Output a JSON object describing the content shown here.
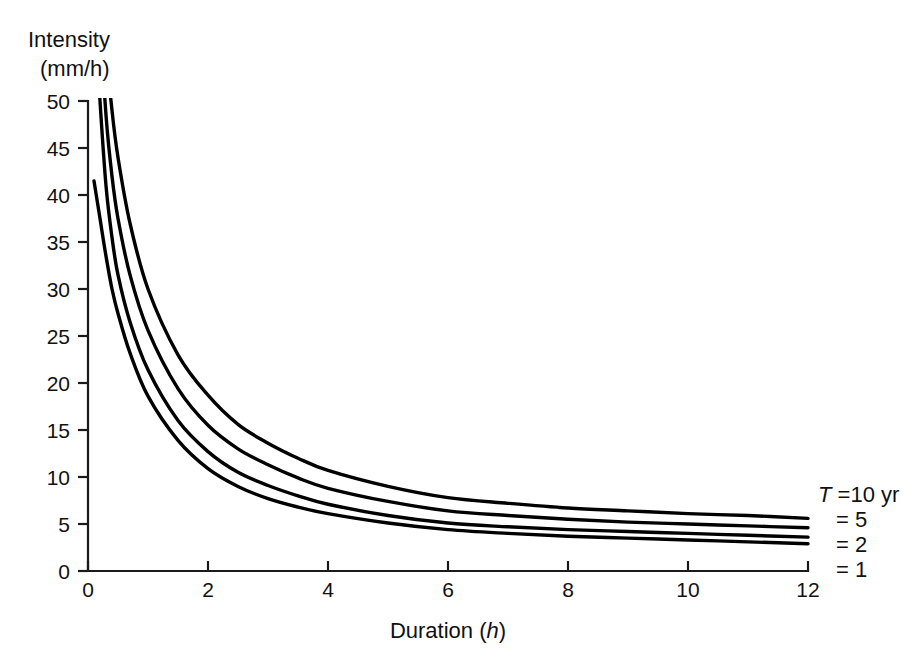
{
  "chart_data": {
    "type": "line",
    "title": "",
    "xlabel": "Duration (h)",
    "ylabel": "Intensity (mm/h)",
    "xlim": [
      0,
      12
    ],
    "ylim": [
      0,
      50
    ],
    "grid": false,
    "legend_position": "right",
    "x_ticks": [
      0,
      2,
      4,
      6,
      8,
      10,
      12
    ],
    "x_tick_labels": [
      "0",
      "2",
      "4",
      "6",
      "8",
      "10",
      "12"
    ],
    "y_ticks": [
      0,
      5,
      10,
      15,
      20,
      25,
      30,
      35,
      40,
      45,
      50
    ],
    "y_tick_labels": [
      "0",
      "5",
      "10",
      "15",
      "20",
      "25",
      "30",
      "35",
      "40",
      "45",
      "50"
    ],
    "x": [
      0.1,
      0.15,
      0.2,
      0.3,
      0.4,
      0.5,
      0.7,
      1.0,
      1.5,
      2.0,
      2.5,
      3.0,
      3.5,
      4.0,
      5.0,
      6.0,
      7.0,
      8.0,
      9.0,
      10.0,
      11.0,
      12.0
    ],
    "series": [
      {
        "name": "T = 10 yr",
        "legend_label": "T =10 yr",
        "values": [
          88.0,
          76.0,
          68.0,
          56.0,
          49.0,
          44.0,
          37.0,
          30.0,
          23.0,
          18.7,
          15.6,
          13.6,
          12.0,
          10.7,
          9.0,
          7.8,
          7.2,
          6.7,
          6.4,
          6.1,
          5.9,
          5.6
        ],
        "color": "#000000"
      },
      {
        "name": "T = 5 yr",
        "legend_label": "= 5",
        "values": [
          76.0,
          66.0,
          59.0,
          48.5,
          42.0,
          37.5,
          31.5,
          25.6,
          19.4,
          15.5,
          13.0,
          11.3,
          9.9,
          8.8,
          7.4,
          6.4,
          5.9,
          5.5,
          5.2,
          5.0,
          4.8,
          4.6
        ],
        "color": "#000000"
      },
      {
        "name": "T = 2 yr",
        "legend_label": "= 2",
        "values": [
          64.0,
          56.0,
          50.0,
          41.0,
          35.5,
          31.5,
          26.5,
          21.4,
          16.0,
          12.7,
          10.5,
          9.1,
          8.0,
          7.1,
          5.9,
          5.1,
          4.7,
          4.4,
          4.2,
          4.0,
          3.8,
          3.6
        ],
        "color": "#000000"
      },
      {
        "name": "T = 1 yr",
        "legend_label": "= 1",
        "values": [
          41.5,
          39.5,
          37.5,
          33.5,
          30.0,
          27.4,
          23.2,
          18.6,
          13.9,
          10.9,
          9.0,
          7.7,
          6.8,
          6.1,
          5.1,
          4.4,
          4.0,
          3.7,
          3.5,
          3.3,
          3.1,
          2.9
        ],
        "color": "#000000"
      }
    ],
    "legend_entries": [
      {
        "label_prefix": "T",
        "label_rest": " =10 yr",
        "italic_prefix": true
      },
      {
        "label_prefix": "",
        "label_rest": "= 5",
        "italic_prefix": false
      },
      {
        "label_prefix": "",
        "label_rest": "= 2",
        "italic_prefix": false
      },
      {
        "label_prefix": "",
        "label_rest": "= 1",
        "italic_prefix": false
      }
    ],
    "ylabel_line1": "Intensity",
    "ylabel_line2": "(mm/h)",
    "xlabel_text": "Duration (",
    "xlabel_italic": "h",
    "xlabel_tail": ")"
  }
}
